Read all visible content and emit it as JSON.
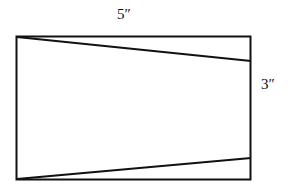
{
  "diagram": {
    "labels": {
      "width": "5″",
      "height": "3″"
    },
    "colors": {
      "stroke": "#111111",
      "background": "#ffffff"
    }
  }
}
